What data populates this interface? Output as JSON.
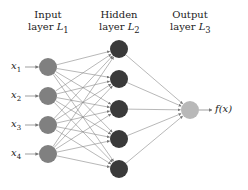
{
  "layers": [
    {
      "title": "Input",
      "subtitle_prefix": "layer ",
      "symbol": "L",
      "index": "1",
      "node_color": "#808080"
    },
    {
      "title": "Hidden",
      "subtitle_prefix": "layer ",
      "symbol": "L",
      "index": "2",
      "node_color": "#3a3a3a"
    },
    {
      "title": "Output",
      "subtitle_prefix": "layer ",
      "symbol": "L",
      "index": "3",
      "node_color": "#b8b8b8"
    }
  ],
  "inputs": [
    {
      "var": "x",
      "sub": "1"
    },
    {
      "var": "x",
      "sub": "2"
    },
    {
      "var": "x",
      "sub": "3"
    },
    {
      "var": "x",
      "sub": "4"
    }
  ],
  "output_label": "f(x)",
  "geometry": {
    "input_nodes": [
      [
        48,
        67
      ],
      [
        48,
        96
      ],
      [
        48,
        125
      ],
      [
        48,
        154
      ]
    ],
    "hidden_nodes": [
      [
        119,
        49
      ],
      [
        119,
        79
      ],
      [
        119,
        109
      ],
      [
        119,
        139
      ],
      [
        119,
        169
      ]
    ],
    "output_nodes": [
      [
        190,
        110
      ]
    ],
    "radius": 9
  },
  "colors": {
    "edge": "#888888",
    "text": "#222222"
  }
}
